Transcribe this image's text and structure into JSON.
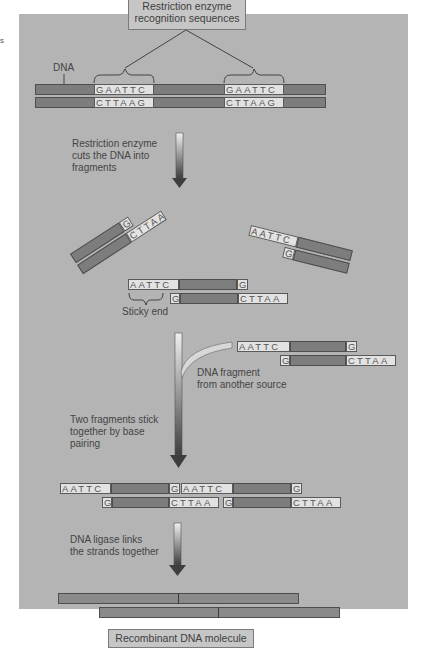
{
  "stray_text": "s",
  "top_label": {
    "line1": "Restriction enzyme",
    "line2": "recognition sequences"
  },
  "dna_label": "DNA",
  "original_dna": {
    "top_seq": [
      "GAATTC",
      "GAATTC"
    ],
    "bottom_seq": [
      "CTTAAG",
      "CTTAAG"
    ]
  },
  "step1": {
    "line1": "Restriction enzyme",
    "line2": "cuts the DNA into",
    "line3": "fragments"
  },
  "left_fragment": {
    "top": "G",
    "bottom": "CTTAA"
  },
  "right_fragment": {
    "top": "AATTC",
    "bottom": "G"
  },
  "center_fragment": {
    "top_left": "AATTC",
    "top_right": "G",
    "bottom_left": "G",
    "bottom_right": "CTTAA"
  },
  "sticky_end_label": "Sticky end",
  "foreign_fragment": {
    "top_left": "AATTC",
    "top_right": "G",
    "bottom_left": "G",
    "bottom_right": "CTTAA"
  },
  "foreign_label": {
    "line1": "DNA fragment",
    "line2": "from another source"
  },
  "step2": {
    "line1": "Two fragments stick",
    "line2": "together by base",
    "line3": "pairing"
  },
  "paired": {
    "top": [
      "AATTC",
      "G",
      "AATTC",
      "G"
    ],
    "bottom": [
      "G",
      "CTTAA",
      "G",
      "CTTAA"
    ]
  },
  "step3": {
    "line1": "DNA ligase links",
    "line2": "the strands together"
  },
  "bottom_label": "Recombinant DNA molecule",
  "colors": {
    "panel": "#b4b4b4",
    "strand": "#7d7d7d",
    "sequence_box": "#e2e2e2",
    "label_box": "#c6c6c6"
  }
}
